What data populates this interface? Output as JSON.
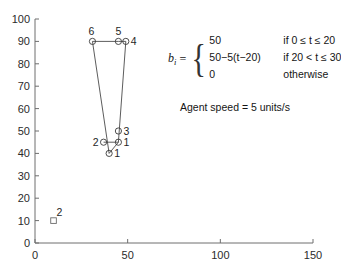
{
  "chart_data": {
    "type": "scatter",
    "title": "",
    "xlabel": "",
    "ylabel": "",
    "xlim": [
      0,
      150
    ],
    "ylim": [
      0,
      100
    ],
    "xticks": [
      0,
      50,
      100,
      150
    ],
    "yticks": [
      0,
      10,
      20,
      30,
      40,
      50,
      60,
      70,
      80,
      90,
      100
    ],
    "xticklabels": [
      "0",
      "50",
      "100",
      "150"
    ],
    "yticklabels": [
      "0",
      "10",
      "20",
      "30",
      "40",
      "50",
      "60",
      "70",
      "80",
      "90",
      "100"
    ],
    "grid": false,
    "legend": "none",
    "series": [
      {
        "name": "targets",
        "marker": "circle",
        "points": [
          {
            "label": "6",
            "x": 31,
            "y": 90,
            "label_pos": "above-left"
          },
          {
            "label": "5",
            "x": 45,
            "y": 90,
            "label_pos": "above"
          },
          {
            "label": "4",
            "x": 49,
            "y": 90,
            "label_pos": "right"
          },
          {
            "label": "3",
            "x": 45,
            "y": 50,
            "label_pos": "right"
          },
          {
            "label": "1",
            "x": 45,
            "y": 45,
            "label_pos": "right"
          },
          {
            "label": "2",
            "x": 37,
            "y": 45,
            "label_pos": "left"
          },
          {
            "label": "1",
            "x": 40,
            "y": 40,
            "label_pos": "right"
          }
        ]
      },
      {
        "name": "agents",
        "marker": "square",
        "points": [
          {
            "label": "2",
            "x": 10,
            "y": 10,
            "label_pos": "above-right"
          }
        ]
      }
    ],
    "edges": [
      {
        "from": [
          31,
          90
        ],
        "to": [
          45,
          90
        ]
      },
      {
        "from": [
          45,
          90
        ],
        "to": [
          49,
          90
        ]
      },
      {
        "from": [
          31,
          90
        ],
        "to": [
          40,
          40
        ]
      },
      {
        "from": [
          49,
          90
        ],
        "to": [
          45,
          45
        ]
      },
      {
        "from": [
          37,
          45
        ],
        "to": [
          45,
          45
        ]
      },
      {
        "from": [
          45,
          45
        ],
        "to": [
          40,
          40
        ]
      }
    ]
  },
  "annotation": {
    "lhs_symbol": "b",
    "lhs_subscript": "i",
    "equals": "=",
    "cases": [
      {
        "value": "50",
        "condition": "if 0 ≤ t ≤ 20"
      },
      {
        "value": "50−5(t−20)",
        "condition": "if 20 < t ≤ 30"
      },
      {
        "value": "0",
        "condition": "otherwise"
      }
    ],
    "agent_speed_note": "Agent speed = 5 units/s"
  }
}
